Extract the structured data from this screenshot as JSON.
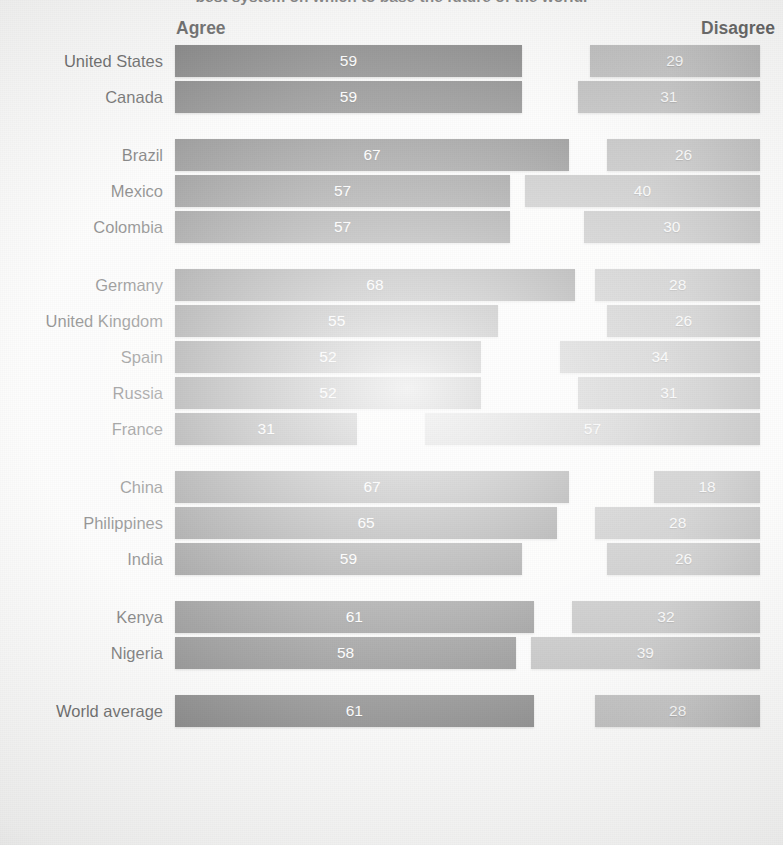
{
  "title": "best system on which to base the future of the world.",
  "header": {
    "agree": "Agree",
    "disagree": "Disagree"
  },
  "colors": {
    "agree_bar": "#3e3e3e",
    "disagree_bar": "#949494",
    "value_text": "#ffffff",
    "label_text": "#111111",
    "paper": "#fbfbfa"
  },
  "chart_data": {
    "type": "bar",
    "orientation": "horizontal",
    "layout": "diverging-paired",
    "title": "best system on which to base the future of the world.",
    "xlabel": "",
    "ylabel": "",
    "xlim": [
      0,
      100
    ],
    "grid": false,
    "legend_position": "top",
    "value_unit": "percent",
    "axis_anchor": {
      "agree": "left",
      "disagree": "right"
    },
    "series": [
      {
        "name": "Agree",
        "values": [
          59,
          59,
          67,
          57,
          57,
          68,
          55,
          52,
          52,
          31,
          67,
          65,
          59,
          61,
          58,
          61
        ]
      },
      {
        "name": "Disagree",
        "values": [
          29,
          31,
          26,
          40,
          30,
          28,
          26,
          34,
          31,
          57,
          18,
          28,
          26,
          32,
          39,
          28
        ]
      }
    ],
    "categories": [
      "United States",
      "Canada",
      "Brazil",
      "Mexico",
      "Colombia",
      "Germany",
      "United Kingdom",
      "Spain",
      "Russia",
      "France",
      "China",
      "Philippines",
      "India",
      "Kenya",
      "Nigeria",
      "World average"
    ],
    "groups": [
      {
        "name": "North America",
        "categories": [
          "United States",
          "Canada"
        ]
      },
      {
        "name": "Latin America",
        "categories": [
          "Brazil",
          "Mexico",
          "Colombia"
        ]
      },
      {
        "name": "Europe",
        "categories": [
          "Germany",
          "United Kingdom",
          "Spain",
          "Russia",
          "France"
        ]
      },
      {
        "name": "Asia",
        "categories": [
          "China",
          "Philippines",
          "India"
        ]
      },
      {
        "name": "Africa",
        "categories": [
          "Kenya",
          "Nigeria"
        ]
      },
      {
        "name": "Total",
        "categories": [
          "World average"
        ]
      }
    ]
  },
  "rows": [
    {
      "label": "United States",
      "agree": 59,
      "disagree": 29,
      "group_end": false
    },
    {
      "label": "Canada",
      "agree": 59,
      "disagree": 31,
      "group_end": true
    },
    {
      "label": "Brazil",
      "agree": 67,
      "disagree": 26,
      "group_end": false
    },
    {
      "label": "Mexico",
      "agree": 57,
      "disagree": 40,
      "group_end": false
    },
    {
      "label": "Colombia",
      "agree": 57,
      "disagree": 30,
      "group_end": true
    },
    {
      "label": "Germany",
      "agree": 68,
      "disagree": 28,
      "group_end": false
    },
    {
      "label": "United Kingdom",
      "agree": 55,
      "disagree": 26,
      "group_end": false
    },
    {
      "label": "Spain",
      "agree": 52,
      "disagree": 34,
      "group_end": false
    },
    {
      "label": "Russia",
      "agree": 52,
      "disagree": 31,
      "group_end": false
    },
    {
      "label": "France",
      "agree": 31,
      "disagree": 57,
      "group_end": true
    },
    {
      "label": "China",
      "agree": 67,
      "disagree": 18,
      "group_end": false
    },
    {
      "label": "Philippines",
      "agree": 65,
      "disagree": 28,
      "group_end": false
    },
    {
      "label": "India",
      "agree": 59,
      "disagree": 26,
      "group_end": true
    },
    {
      "label": "Kenya",
      "agree": 61,
      "disagree": 32,
      "group_end": false
    },
    {
      "label": "Nigeria",
      "agree": 58,
      "disagree": 39,
      "group_end": true
    },
    {
      "label": "World average",
      "agree": 61,
      "disagree": 28,
      "group_end": false
    }
  ],
  "scale": {
    "px_per_unit": 5.88,
    "plot_left_px": 175,
    "plot_width_px": 585
  }
}
